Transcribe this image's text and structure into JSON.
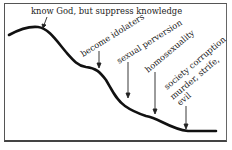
{
  "diagram": {
    "type": "declining-curve",
    "stages": [
      {
        "id": "stage-1",
        "label": "know God, but suppress knowledge"
      },
      {
        "id": "stage-2",
        "label": "become idolaters"
      },
      {
        "id": "stage-3",
        "label": "sexual perversion"
      },
      {
        "id": "stage-4",
        "label": "homosexuality"
      },
      {
        "id": "stage-5",
        "label_lines": [
          "society corruption",
          "murder, strife,",
          "evil"
        ]
      }
    ],
    "colors": {
      "line": "#111111",
      "text": "#222222",
      "border": "#555555",
      "background": "#ffffff"
    }
  }
}
